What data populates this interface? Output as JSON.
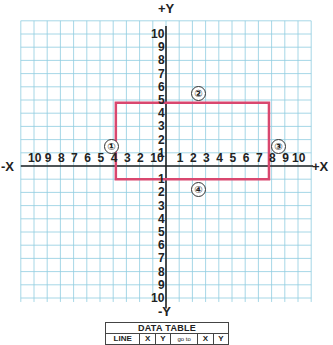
{
  "chart_data": {
    "type": "diagram",
    "axes": {
      "x_positive_label": "+X",
      "x_negative_label": "-X",
      "y_positive_label": "+Y",
      "y_negative_label": "-Y",
      "xlim": [
        -10,
        10
      ],
      "ylim": [
        -10,
        10
      ],
      "x_tick_labels_left": [
        "10",
        "9",
        "8",
        "7",
        "6",
        "5",
        "4",
        "3",
        "2",
        "1"
      ],
      "origin_label": "0",
      "x_tick_labels_right": [
        "1",
        "2",
        "3",
        "4",
        "5",
        "6",
        "7",
        "8",
        "9",
        "10"
      ],
      "y_tick_labels_up": [
        "1",
        "2",
        "3",
        "4",
        "5",
        "6",
        "7",
        "8",
        "9",
        "10"
      ],
      "y_tick_labels_down": [
        "1",
        "2",
        "3",
        "4",
        "5",
        "6",
        "7",
        "8",
        "9",
        "10"
      ],
      "grid": true
    },
    "rectangle": {
      "color": "#d9476f",
      "corners": [
        [
          -3.8,
          4.8
        ],
        [
          7.8,
          4.8
        ],
        [
          7.8,
          -1
        ],
        [
          -3.8,
          -1
        ]
      ],
      "side_markers": [
        {
          "label": "①",
          "side": "left"
        },
        {
          "label": "②",
          "side": "top"
        },
        {
          "label": "③",
          "side": "right"
        },
        {
          "label": "④",
          "side": "bottom"
        }
      ]
    }
  },
  "colors": {
    "grid": "#8fcde0",
    "axis": "#222222",
    "rectangle": "#d9476f"
  },
  "table": {
    "title": "DATA TABLE",
    "headers": [
      "LINE",
      "X",
      "Y",
      "go to",
      "X",
      "Y"
    ]
  }
}
